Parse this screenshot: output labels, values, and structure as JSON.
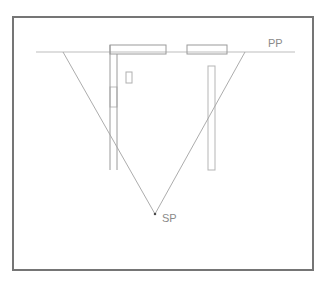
{
  "figure": {
    "background_color": "#ffffff",
    "frame": {
      "name": "figure-border",
      "x": 13,
      "y": 17,
      "width": 300,
      "height": 253,
      "stroke": "#757575",
      "stroke_width": 1.2
    },
    "labels": {
      "picture_plane": "PP",
      "station_point": "SP"
    },
    "label_positions": {
      "picture_plane": {
        "x": 268,
        "y": 47
      },
      "station_point": {
        "x": 162,
        "y": 222
      }
    },
    "colors": {
      "line_light": "#bdbdbd",
      "line_mid": "#a3a3a3",
      "line_dark": "#8a8a8a",
      "frame": "#757575",
      "point": "#4a4a4a",
      "text": "#8a8a8a"
    },
    "picture_plane_line": {
      "name": "picture-plane-line",
      "x1": 36,
      "y1": 52,
      "x2": 295,
      "y2": 52,
      "stroke": "#bdbdbd",
      "stroke_width": 1.2
    },
    "station_point": {
      "name": "station-point-marker",
      "x": 155,
      "y": 214,
      "size": 2.2,
      "fill": "#4a4a4a"
    },
    "sight_lines": [
      {
        "name": "sight-line-left",
        "x1": 63,
        "y1": 52,
        "x2": 155,
        "y2": 214,
        "stroke": "#a3a3a3",
        "stroke_width": 0.9
      },
      {
        "name": "sight-line-right",
        "x1": 245,
        "y1": 52,
        "x2": 155,
        "y2": 214,
        "stroke": "#a3a3a3",
        "stroke_width": 0.9
      }
    ],
    "plan_rectangles": [
      {
        "name": "plan-block-left",
        "x": 110,
        "y": 45,
        "width": 56,
        "height": 9,
        "stroke": "#9a9a9a",
        "stroke_width": 1.0
      },
      {
        "name": "plan-block-right",
        "x": 187,
        "y": 45,
        "width": 40,
        "height": 9,
        "stroke": "#9a9a9a",
        "stroke_width": 1.0
      },
      {
        "name": "plan-pier-right",
        "x": 208,
        "y": 66,
        "width": 7,
        "height": 104,
        "stroke": "#b5b5b5",
        "stroke_width": 1.0
      },
      {
        "name": "plan-door-swing",
        "x": 110,
        "y": 87,
        "width": 7,
        "height": 20,
        "stroke": "#bdbdbd",
        "stroke_width": 1.0
      },
      {
        "name": "plan-column-small",
        "x": 126,
        "y": 72,
        "width": 6,
        "height": 11,
        "stroke": "#b0b0b0",
        "stroke_width": 1.0
      }
    ],
    "wall_lines": [
      {
        "name": "wall-line-outer-left",
        "x1": 110,
        "y1": 45,
        "x2": 110,
        "y2": 170,
        "stroke": "#9a9a9a",
        "stroke_width": 1.0
      },
      {
        "name": "wall-line-inner-left",
        "x1": 117,
        "y1": 54,
        "x2": 117,
        "y2": 170,
        "stroke": "#9a9a9a",
        "stroke_width": 1.0
      }
    ]
  }
}
